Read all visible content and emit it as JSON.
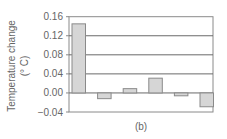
{
  "chart_data": {
    "type": "bar",
    "title": "",
    "caption": "(b)",
    "xlabel": "",
    "ylabel": "Temperature change",
    "ylabel_unit": "(° C)",
    "categories": [
      "1",
      "2",
      "3",
      "4",
      "5",
      "6"
    ],
    "values": [
      0.145,
      -0.012,
      0.009,
      0.031,
      -0.006,
      -0.029
    ],
    "ylim": [
      -0.04,
      0.16
    ],
    "yticks": [
      0.16,
      0.12,
      0.08,
      0.04,
      0.0,
      -0.04
    ],
    "ytick_labels": [
      "0.16",
      "0.12",
      "0.08",
      "0.04",
      "0.00",
      "−0.04"
    ],
    "grid": true,
    "legend": null,
    "colors": {
      "bar_fill": "#d6d6d6",
      "bar_stroke": "#8a8a8a",
      "grid": "#6a6a6a",
      "frame": "#8a8a8a"
    }
  }
}
